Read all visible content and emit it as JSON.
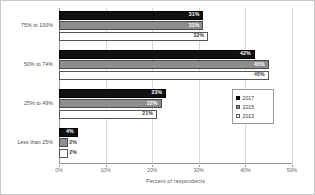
{
  "chart_data": {
    "type": "bar",
    "orientation": "horizontal",
    "title": "",
    "subtitle": "",
    "xlabel": "Percent of respondents",
    "ylabel": "",
    "xlim": [
      0,
      50
    ],
    "xtick_labels": [
      "0%",
      "10%",
      "20%",
      "30%",
      "40%",
      "50%"
    ],
    "xtick_values": [
      0,
      10,
      20,
      30,
      40,
      50
    ],
    "grid": true,
    "legend_position": "right-middle",
    "categories": [
      "75% to 100%",
      "50% to 74%",
      "25% to 49%",
      "Less than 25%"
    ],
    "series": [
      {
        "name": "2017",
        "color": "#111111",
        "values": [
          31,
          42,
          23,
          4
        ],
        "labels": [
          "31%",
          "42%",
          "23%",
          "4%"
        ],
        "label_placement": [
          "inside",
          "inside",
          "inside",
          "inside"
        ]
      },
      {
        "name": "2015",
        "color": "#8d8d8d",
        "values": [
          31,
          45,
          22,
          2
        ],
        "labels": [
          "31%",
          "45%",
          "22%",
          "2%"
        ],
        "label_placement": [
          "inside",
          "inside",
          "inside",
          "outside"
        ]
      },
      {
        "name": "2013",
        "color": "#ffffff",
        "values": [
          32,
          45,
          21,
          2
        ],
        "labels": [
          "32%",
          "45%",
          "21%",
          "2%"
        ],
        "label_placement": [
          "inside",
          "inside",
          "inside",
          "outside"
        ]
      }
    ]
  },
  "legend": {
    "items": [
      {
        "label": "2017"
      },
      {
        "label": "2015"
      },
      {
        "label": "2013"
      }
    ]
  }
}
